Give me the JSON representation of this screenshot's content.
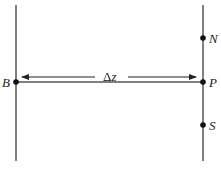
{
  "diagram": {
    "labels": {
      "B": "B",
      "P": "P",
      "N": "N",
      "S": "S",
      "delta_z": "Δz"
    },
    "colors": {
      "line": "#555555",
      "dot": "#111111"
    }
  }
}
